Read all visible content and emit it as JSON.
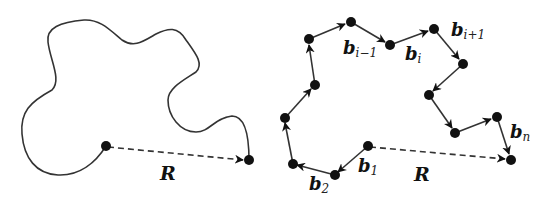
{
  "figure": {
    "left_panel": {
      "description": "Continuous polymer chain contour",
      "end_to_end_label": "R"
    },
    "right_panel": {
      "description": "Freely jointed chain of bond vectors",
      "end_to_end_label": "R",
      "bond_labels": {
        "b1": {
          "base": "b",
          "sub": "1"
        },
        "b2": {
          "base": "b",
          "sub": "2"
        },
        "bim1": {
          "base": "b",
          "sub": "i−1"
        },
        "bi": {
          "base": "b",
          "sub": "i"
        },
        "bip1": {
          "base": "b",
          "sub": "i+1"
        },
        "bn": {
          "base": "b",
          "sub": "n"
        }
      }
    },
    "colors": {
      "line": "#333333",
      "node": "#111111",
      "background": "#ffffff"
    }
  }
}
